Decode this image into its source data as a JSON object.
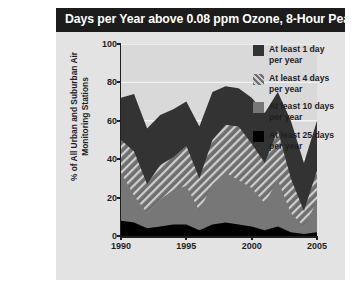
{
  "figure": {
    "title": "Days per Year above 0.08 ppm Ozone, 8-Hour Peak",
    "title_bar_color": "#1c1c1c",
    "panel_color": "#e3e3e3",
    "plot_color": "#d9d9d9"
  },
  "legend": {
    "items": [
      {
        "label_line1": "At least 1 day",
        "label_line2": "per year",
        "swatch": "dark-gray-swatch",
        "color": "#333333",
        "pattern": "solid"
      },
      {
        "label_line1": "At least 4 days",
        "label_line2": "per year",
        "swatch": "hatched-swatch",
        "color": "#7a7a7a",
        "pattern": "diagonal-hatch"
      },
      {
        "label_line1": "At least 10 days",
        "label_line2": "per year",
        "swatch": "medium-gray-swatch",
        "color": "#777777",
        "pattern": "solid"
      },
      {
        "label_line1": "At least 25 days",
        "label_line2": "per year",
        "swatch": "black-swatch",
        "color": "#000000",
        "pattern": "solid"
      }
    ]
  },
  "chart_data": {
    "type": "area",
    "title": "Days per Year above 0.08 ppm Ozone, 8-Hour Peak",
    "xlabel": "",
    "ylabel": "% of All Urban and Suburban Air Monitoring Stations",
    "xlim": [
      1990,
      2005
    ],
    "ylim": [
      0,
      100
    ],
    "yticks": [
      0,
      20,
      40,
      60,
      80,
      100
    ],
    "xticks": [
      1990,
      1995,
      2000,
      2005
    ],
    "grid": "horizontal",
    "legend_position": "right",
    "stacking": "overlaid",
    "x": [
      1990,
      1991,
      1992,
      1993,
      1994,
      1995,
      1996,
      1997,
      1998,
      1999,
      2000,
      2001,
      2002,
      2003,
      2004,
      2005
    ],
    "series": [
      {
        "name": "At least 1 day per year",
        "color": "#333333",
        "pattern": "solid",
        "values": [
          72,
          74,
          56,
          63,
          66,
          70,
          57,
          75,
          78,
          77,
          72,
          64,
          75,
          60,
          38,
          60
        ]
      },
      {
        "name": "At least 4 days per year",
        "color": "#7a7a7a",
        "pattern": "diagonal-hatch",
        "values": [
          50,
          44,
          27,
          37,
          41,
          47,
          30,
          50,
          58,
          57,
          48,
          38,
          55,
          30,
          13,
          34
        ]
      },
      {
        "name": "At least 10 days per year",
        "color": "#777777",
        "pattern": "solid",
        "values": [
          33,
          21,
          12,
          19,
          24,
          26,
          13,
          27,
          33,
          29,
          25,
          17,
          29,
          12,
          5,
          18
        ]
      },
      {
        "name": "At least 25 days per year",
        "color": "#000000",
        "pattern": "solid",
        "values": [
          8,
          7,
          4,
          5,
          6,
          6,
          3,
          6,
          7,
          6,
          5,
          3,
          5,
          2,
          1,
          2
        ]
      }
    ]
  }
}
